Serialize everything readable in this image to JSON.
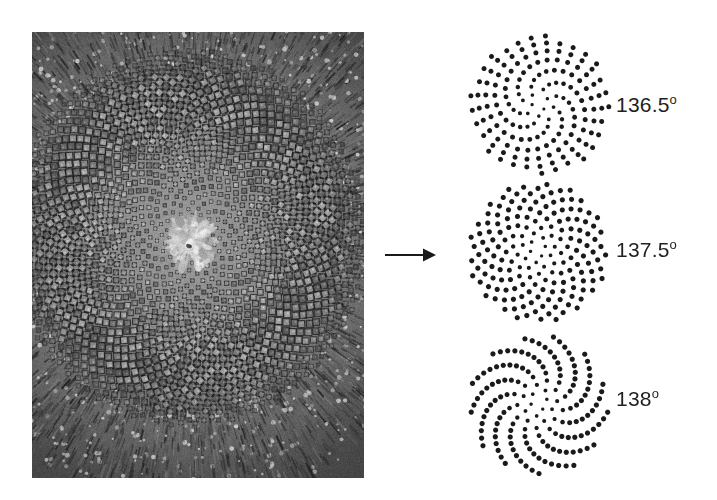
{
  "figure": {
    "background_color": "#ffffff",
    "dot_color": "#1a1a1a",
    "text_color": "#231f20"
  },
  "photo": {
    "name": "sunflower-seed-head-photograph",
    "description": "Grayscale macro photograph of a sunflower capitulum showing tightly packed florets arranged in opposing parastichy spirals, with a bristly involucre ring around the margin",
    "alt": "Sunflower seed head",
    "x": 32,
    "y": 32,
    "width": 332,
    "height": 446
  },
  "arrow": {
    "name": "transform-arrow",
    "direction": "right",
    "x": 383,
    "y": 255,
    "length": 50
  },
  "patterns": [
    {
      "angle_value": "136.5",
      "degree_symbol": "o",
      "label": "136.5",
      "divergence_deg": 136.5,
      "points": 600,
      "spacing_c": 5.6,
      "dot_radius": 2.5,
      "center_x": 84,
      "center_y": 77,
      "appearance": "radial spoke-like arms, roughly 36 visible rays"
    },
    {
      "angle_value": "137.5",
      "degree_symbol": "o",
      "label": "137.5",
      "divergence_deg": 137.5,
      "points": 600,
      "spacing_c": 5.3,
      "dot_radius": 2.6,
      "center_x": 82,
      "center_y": 76,
      "appearance": "uniform golden-angle packing with interlocking 21 and 34 parastichies"
    },
    {
      "angle_value": "138",
      "degree_symbol": "o",
      "label": "138",
      "divergence_deg": 138.0,
      "points": 600,
      "spacing_c": 5.6,
      "dot_radius": 2.6,
      "center_x": 83,
      "center_y": 80,
      "appearance": "roughly 13 bold curved spiral arms"
    }
  ],
  "chart_data": {
    "type": "scatter",
    "series": [
      {
        "name": "136.5",
        "divergence_deg": 136.5,
        "n_points": 600,
        "model": "r = c*sqrt(n), theta = n*136.5deg"
      },
      {
        "name": "137.5",
        "divergence_deg": 137.5,
        "n_points": 600,
        "model": "r = c*sqrt(n), theta = n*137.5deg"
      },
      {
        "name": "138",
        "divergence_deg": 138.0,
        "n_points": 600,
        "model": "r = c*sqrt(n), theta = n*138deg"
      }
    ],
    "xlabel": "",
    "ylabel": "",
    "legend": [
      "136.5",
      "137.5",
      "138"
    ],
    "grid": false
  }
}
